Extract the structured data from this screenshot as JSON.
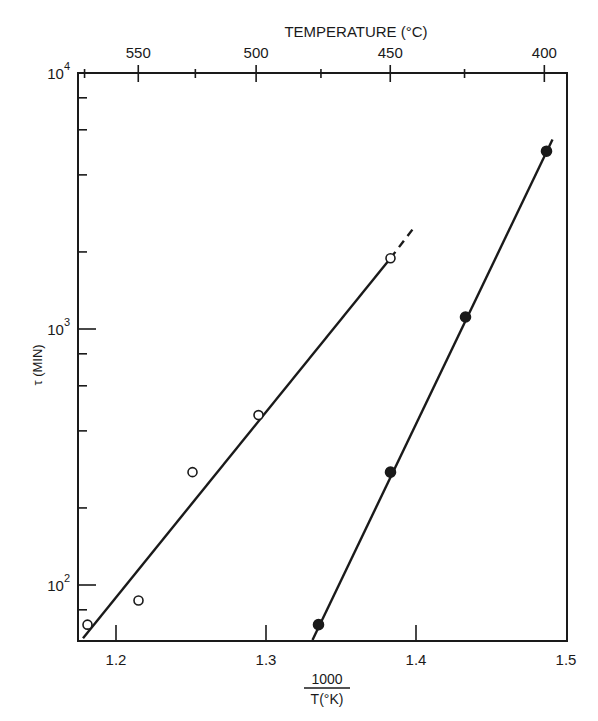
{
  "chart_data": {
    "type": "scatter",
    "title": "",
    "xlabel": "1000 / T(°K)",
    "xlabel_numerator": "1000",
    "xlabel_denominator": "T(°K)",
    "ylabel": "τ (MIN)",
    "top_xlabel": "TEMPERATURE (°C)",
    "yscale": "log",
    "xlim": [
      1.175,
      1.5
    ],
    "ylim": [
      60,
      10000
    ],
    "grid": false,
    "legend": null,
    "x_ticks": [
      1.2,
      1.3,
      1.4,
      1.5
    ],
    "x_tick_labels": [
      "1.2",
      "1.3",
      "1.4",
      "1.5"
    ],
    "y_ticks": [
      100,
      1000,
      10000
    ],
    "y_tick_labels": [
      {
        "base": "10",
        "exp": "2"
      },
      {
        "base": "10",
        "exp": "3"
      },
      {
        "base": "10",
        "exp": "4"
      }
    ],
    "y_minor_ticks": [
      80,
      200,
      400,
      600,
      800,
      2000,
      4000,
      6000,
      8000
    ],
    "top_ticks_celsius": [
      550,
      500,
      450,
      400
    ],
    "top_tick_labels": [
      "550",
      "500",
      "450",
      "400"
    ],
    "top_minor_ticks_celsius": [
      575,
      525,
      475,
      425
    ],
    "series": [
      {
        "name": "open circles",
        "marker": "open-circle",
        "x": [
          1.181,
          1.215,
          1.251,
          1.295,
          1.383
        ],
        "y": [
          70,
          87,
          276,
          461,
          1890
        ],
        "fit_line": {
          "from": [
            1.178,
            62
          ],
          "to": [
            1.383,
            1890
          ],
          "dashed_extension_to": [
            1.4,
            2550
          ]
        }
      },
      {
        "name": "filled circles",
        "marker": "filled-circle",
        "x": [
          1.335,
          1.383,
          1.433,
          1.487
        ],
        "y": [
          70,
          276,
          1114,
          4950
        ],
        "fit_line": {
          "from": [
            1.331,
            61
          ],
          "to": [
            1.491,
            5500
          ]
        }
      }
    ]
  }
}
